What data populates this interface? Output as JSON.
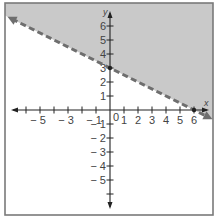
{
  "chart_data": {
    "type": "line",
    "title": "",
    "xlabel": "x",
    "ylabel": "y",
    "xlim": [
      -7.5,
      7.3
    ],
    "ylim": [
      -7.4,
      7.6
    ],
    "grid": false,
    "x_ticks": [
      -6,
      -5,
      -4,
      -3,
      -2,
      -1,
      1,
      2,
      3,
      4,
      5,
      6
    ],
    "x_tick_labels": [
      {
        "value": -5,
        "text": "− 5"
      },
      {
        "value": -3,
        "text": "− 3"
      },
      {
        "value": -1,
        "text": "− 1"
      },
      {
        "value": 1,
        "text": "1"
      },
      {
        "value": 2,
        "text": "2"
      },
      {
        "value": 3,
        "text": "3"
      },
      {
        "value": 4,
        "text": "4"
      },
      {
        "value": 5,
        "text": "5"
      },
      {
        "value": 6,
        "text": "6"
      }
    ],
    "y_ticks": [
      -6,
      -5,
      -4,
      -3,
      -2,
      -1,
      1,
      2,
      3,
      4,
      5,
      6
    ],
    "y_tick_labels": [
      {
        "value": 6,
        "text": "6"
      },
      {
        "value": 5,
        "text": "5"
      },
      {
        "value": 4,
        "text": "4"
      },
      {
        "value": 3,
        "text": "3"
      },
      {
        "value": 2,
        "text": "2"
      },
      {
        "value": 1,
        "text": "1"
      },
      {
        "value": -1,
        "text": "− 1"
      },
      {
        "value": -2,
        "text": "− 2"
      },
      {
        "value": -3,
        "text": "− 3"
      },
      {
        "value": -4,
        "text": "− 4"
      },
      {
        "value": -5,
        "text": "− 5"
      }
    ],
    "origin_label": "0",
    "series": [
      {
        "name": "boundary line y = -x/2 + 3",
        "style": "dashed",
        "points": [
          [
            -7.0,
            6.5
          ],
          [
            0,
            3
          ],
          [
            6,
            0
          ],
          [
            7.0,
            -0.5
          ]
        ],
        "color": "#6e6e6e"
      }
    ],
    "annotations": [
      {
        "type": "shaded-region",
        "description": "half-plane above the dashed line (y > -x/2 + 3)",
        "color": "#c9c9c9"
      }
    ],
    "marked_points": [
      [
        0,
        3
      ],
      [
        6,
        0
      ]
    ]
  },
  "colors": {
    "shade": "#c9c9c9",
    "line": "#6e6e6e",
    "axis": "#222222",
    "frame": "#7a7a7a",
    "text": "#444444"
  }
}
